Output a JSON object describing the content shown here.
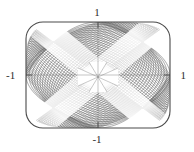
{
  "figure": {
    "kind": "parametric-mesh-plot",
    "background_color": "#ffffff",
    "mesh_color": "#555555",
    "mesh_highlight_color": "#ffffff",
    "frame_color": "#4a4a4a",
    "axis_color": "#6f6f6f",
    "label_color": "#2b2b2b"
  },
  "axes": {
    "x_label_left": "-1",
    "x_label_right": "1",
    "y_label_top": "1",
    "y_label_bottom": "-1"
  },
  "chart_data": {
    "type": "line",
    "title": "",
    "xlabel": "",
    "ylabel": "",
    "xlim": [
      -1,
      1
    ],
    "ylim": [
      -1,
      1
    ],
    "xticks": [
      -1,
      1
    ],
    "yticks": [
      -1,
      1
    ],
    "xticklabels": [
      "-1",
      "1"
    ],
    "yticklabels": [
      "-1",
      "1"
    ],
    "grid": false,
    "legend": null,
    "series": [
      {
        "name": "mesh-family-u",
        "count": 48,
        "color": "#555555"
      },
      {
        "name": "mesh-family-v",
        "count": 48,
        "color": "#555555"
      }
    ],
    "annotations": [
      {
        "text": "1",
        "x": 0,
        "y": 1,
        "position": "top"
      },
      {
        "text": "-1",
        "x": -1,
        "y": 0,
        "position": "left"
      },
      {
        "text": "1",
        "x": 1,
        "y": 0,
        "position": "right"
      },
      {
        "text": "-1",
        "x": 0,
        "y": -1,
        "position": "bottom"
      }
    ]
  }
}
